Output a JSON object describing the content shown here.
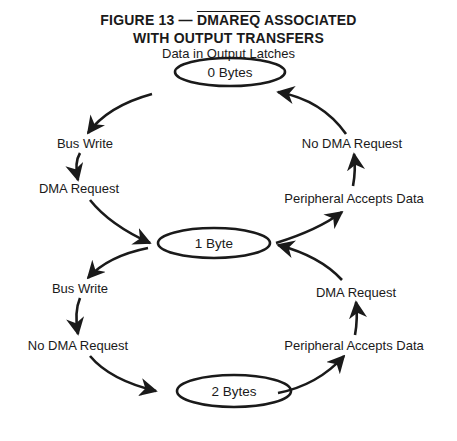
{
  "figure": {
    "title_prefix": "FIGURE 13 — ",
    "title_signal": "DMAREQ",
    "title_suffix": " ASSOCIATED",
    "title_line2": "WITH OUTPUT TRANSFERS",
    "subtitle": "Data in Output Latches"
  },
  "states": [
    {
      "id": "s0",
      "label": "0 Bytes"
    },
    {
      "id": "s1",
      "label": "1 Byte"
    },
    {
      "id": "s2",
      "label": "2 Bytes"
    }
  ],
  "transitions": [
    {
      "from": "0 Bytes",
      "to": "1 Byte",
      "side": "left",
      "labels": [
        "Bus Write",
        "DMA Request"
      ]
    },
    {
      "from": "1 Byte",
      "to": "0 Bytes",
      "side": "right",
      "labels": [
        "Peripheral Accepts Data",
        "No DMA Request"
      ]
    },
    {
      "from": "1 Byte",
      "to": "2 Bytes",
      "side": "left",
      "labels": [
        "Bus Write",
        "No DMA Request"
      ]
    },
    {
      "from": "2 Bytes",
      "to": "1 Byte",
      "side": "right",
      "labels": [
        "Peripheral Accepts Data",
        "DMA Request"
      ]
    }
  ],
  "labels": {
    "top_left_1": "Bus Write",
    "top_left_2": "DMA Request",
    "top_right_1": "No DMA Request",
    "top_right_2": "Peripheral Accepts Data",
    "bottom_left_1": "Bus Write",
    "bottom_left_2": "No DMA Request",
    "bottom_right_1": "DMA Request",
    "bottom_right_2": "Peripheral Accepts Data"
  },
  "colors": {
    "ink": "#1a1a1a",
    "background": "#ffffff"
  }
}
